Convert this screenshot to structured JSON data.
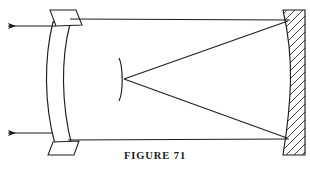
{
  "figure": {
    "caption": "FIGURE 71",
    "title": "FIGURE 71",
    "type": "optical-ray-diagram",
    "background_color": "#ffffff",
    "ink_color": "#1d1d1d"
  },
  "components": {
    "corrector_lens": {
      "label": "meniscus corrector lens",
      "shape": "curved meniscus with flat mounting flanges",
      "x_center": 64,
      "y_top": 10,
      "y_bottom": 152
    },
    "secondary_mirror": {
      "label": "convex secondary mirror",
      "shape": "small vertical arc",
      "x_center": 121,
      "y_top": 58,
      "y_bottom": 101,
      "focus_y": 79
    },
    "primary_mirror": {
      "label": "concave primary mirror",
      "shape": "hatched cross-section wedge",
      "x_left": 283,
      "x_right": 305,
      "y_top": 10,
      "y_bottom": 155,
      "hatch_angle_deg": 45
    }
  },
  "rays": {
    "upper_incoming": {
      "label": "upper horizontal ray",
      "y": 19,
      "x_start": 70,
      "x_end": 290
    },
    "lower_incoming": {
      "label": "lower horizontal ray",
      "y": 140,
      "x_start": 70,
      "x_end": 288
    },
    "upper_reflected": {
      "label": "upper converging ray",
      "from_x": 288,
      "from_y": 20,
      "to_x": 124,
      "to_y": 79
    },
    "lower_reflected": {
      "label": "lower converging ray",
      "from_x": 286,
      "from_y": 139,
      "to_x": 124,
      "to_y": 79
    },
    "upper_output_arrow": {
      "label": "upper exit ray arrow",
      "y": 26,
      "x_start": 50,
      "x_end": 4,
      "direction": "left"
    },
    "lower_output_arrow": {
      "label": "lower exit ray arrow",
      "y": 133,
      "x_start": 50,
      "x_end": 4,
      "direction": "left"
    }
  }
}
